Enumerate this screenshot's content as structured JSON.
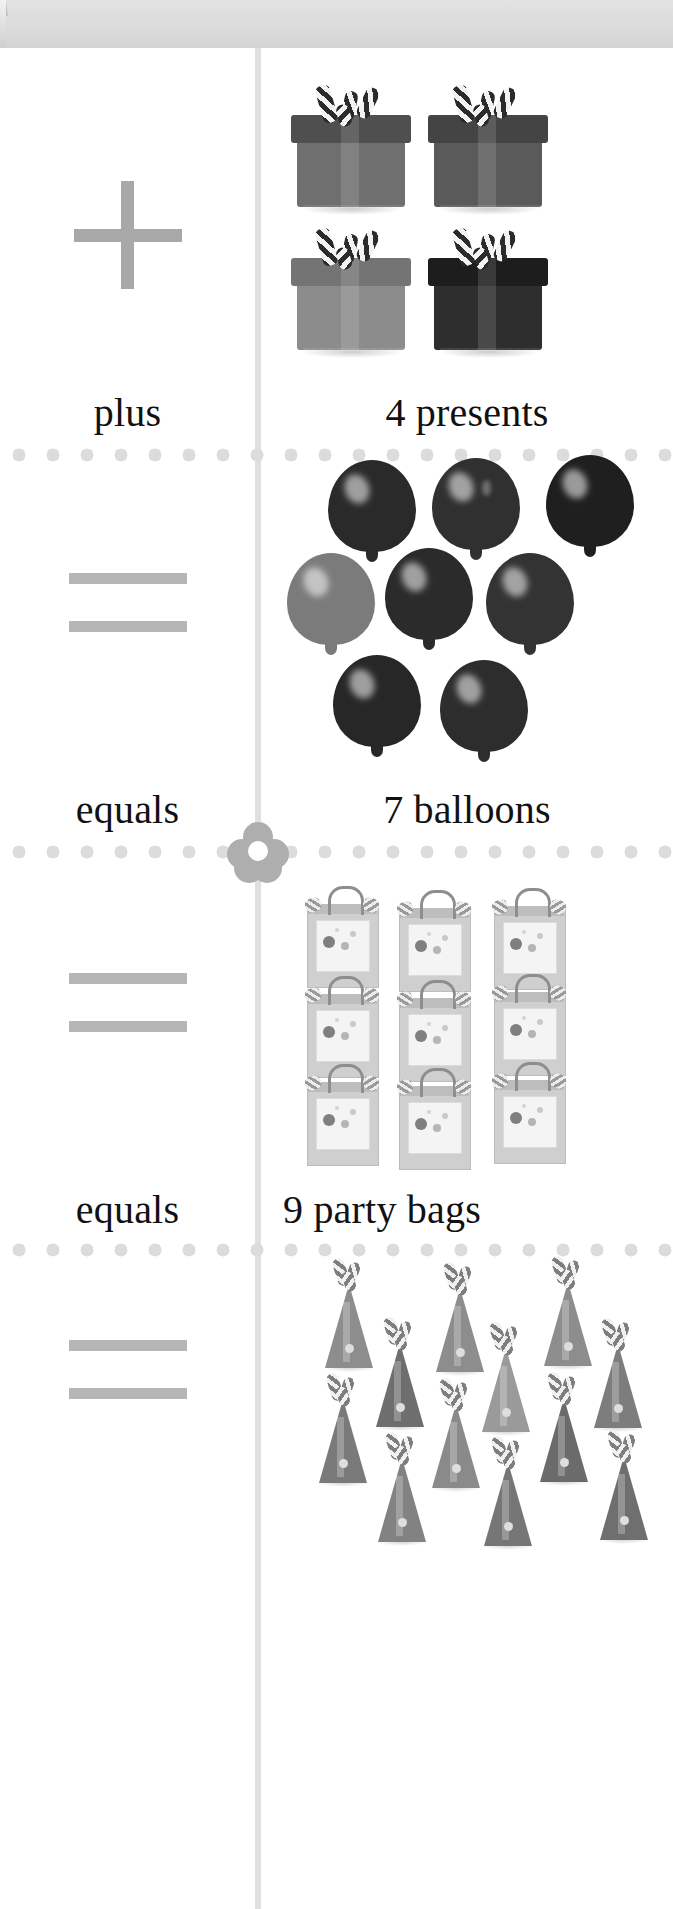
{
  "page": {
    "background_color": "#ffffff",
    "header_band_color": "#dcdcdc",
    "divider_color": "#e0e0e0",
    "dot_color": "#dcdcdc",
    "symbol_color": "#a8a8a8",
    "text_color": "#111111",
    "flower_color": "#aeaeae"
  },
  "rows": [
    {
      "operator_icon": "plus-sign",
      "operator_word": "plus",
      "count_label": "4 presents",
      "item_name": "present",
      "item_count": 4,
      "items": [
        {
          "color": "#6f6f6f"
        },
        {
          "color": "#5a5a5a"
        },
        {
          "color": "#8c8c8c"
        },
        {
          "color": "#2e2e2e"
        }
      ]
    },
    {
      "operator_icon": "equals-sign",
      "operator_word": "equals",
      "count_label": "7 balloons",
      "item_name": "balloon",
      "item_count": 7,
      "items": [
        {
          "color": "#2a2a2a"
        },
        {
          "color": "#303030"
        },
        {
          "color": "#1f1f1f"
        },
        {
          "color": "#7b7b7b"
        },
        {
          "color": "#2b2b2b"
        },
        {
          "color": "#333333"
        },
        {
          "color": "#272727"
        },
        {
          "color": "#2d2d2d"
        }
      ]
    },
    {
      "operator_icon": "equals-sign",
      "operator_word": "equals",
      "count_label": "9 party bags",
      "item_name": "party-bag",
      "item_count": 9
    },
    {
      "operator_icon": "equals-sign",
      "operator_word": "",
      "count_label": "",
      "item_name": "party-hat",
      "item_count": 12
    }
  ],
  "flower_marker": {
    "petals": 5,
    "name": "flower-divider-marker"
  }
}
